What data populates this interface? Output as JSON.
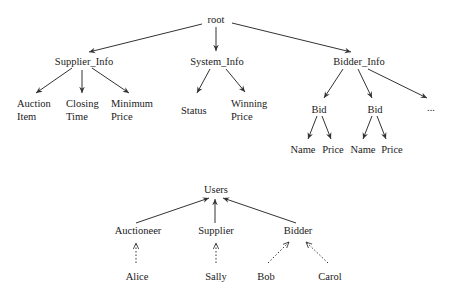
{
  "data_tree": {
    "root": "root",
    "children": [
      {
        "label": "Supplier_Info",
        "children": [
          {
            "label": "Auction Item",
            "lines": [
              "Auction",
              "Item"
            ]
          },
          {
            "label": "Closing Time",
            "lines": [
              "Closing",
              "Time"
            ]
          },
          {
            "label": "Minimum Price",
            "lines": [
              "Minimum",
              "Price"
            ]
          }
        ]
      },
      {
        "label": "System_Info",
        "children": [
          {
            "label": "Status"
          },
          {
            "label": "Winning Price",
            "lines": [
              "Winning",
              "Price"
            ]
          }
        ]
      },
      {
        "label": "Bidder_Info",
        "children": [
          {
            "label": "Bid",
            "children": [
              {
                "label": "Name"
              },
              {
                "label": "Price"
              }
            ]
          },
          {
            "label": "Bid",
            "children": [
              {
                "label": "Name"
              },
              {
                "label": "Price"
              }
            ]
          },
          {
            "label": "..."
          }
        ]
      }
    ]
  },
  "user_tree": {
    "root": "Users",
    "roles": [
      {
        "label": "Auctioneer",
        "members": [
          "Alice"
        ]
      },
      {
        "label": "Supplier",
        "members": [
          "Sally"
        ]
      },
      {
        "label": "Bidder",
        "members": [
          "Bob",
          "Carol"
        ]
      }
    ]
  },
  "labels": {
    "root": "root",
    "supplier_info": "Supplier_Info",
    "system_info": "System_Info",
    "bidder_info": "Bidder_Info",
    "auction": "Auction",
    "item": "Item",
    "closing": "Closing",
    "time": "Time",
    "minimum": "Minimum",
    "min_price": "Price",
    "status": "Status",
    "winning": "Winning",
    "win_price": "Price",
    "bid": "Bid",
    "name": "Name",
    "price": "Price",
    "ellipsis": "...",
    "users": "Users",
    "auctioneer": "Auctioneer",
    "supplier": "Supplier",
    "bidder": "Bidder",
    "alice": "Alice",
    "sally": "Sally",
    "bob": "Bob",
    "carol": "Carol"
  },
  "colors": {
    "line": "#333333",
    "text": "#1a1a1a",
    "background": "#ffffff"
  }
}
